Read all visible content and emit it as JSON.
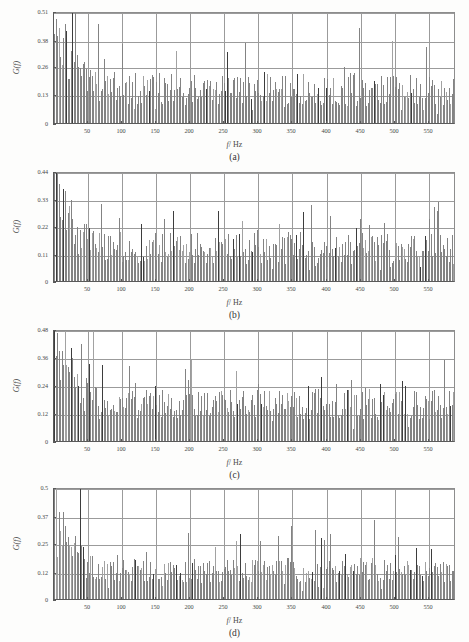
{
  "figure": {
    "type": "multi-panel-spectrum-figure",
    "panel_count": 4,
    "background_color": "#fdfdfc",
    "bar_color": "#838383",
    "bar_dark_color": "#3d3d3d",
    "grid_color": "#9b9b9b",
    "axis_color": "#5a5a5a"
  },
  "axis_labels": {
    "x_symbol": "f",
    "x_unit": "/ Hz",
    "y_text": "G(f)"
  },
  "captions": {
    "a": "(a)",
    "b": "(b)",
    "c": "(c)",
    "d": "(d)"
  },
  "chart_data": [
    {
      "id": "a",
      "type": "bar",
      "title": "(a)",
      "xlabel": "f/ Hz",
      "ylabel": "G(f)",
      "xlim": [
        0,
        590
      ],
      "ylim": [
        0,
        0.51
      ],
      "grid": true,
      "xticks": [
        50,
        100,
        150,
        200,
        250,
        300,
        350,
        400,
        450,
        500,
        550
      ],
      "xticklabels": [
        "50",
        "100",
        "150",
        "200",
        "250",
        "300",
        "350",
        "400",
        "450",
        "500",
        "550"
      ],
      "yticks": [
        0,
        0.13,
        0.26,
        0.38,
        0.51
      ],
      "yticklabels": [
        "0",
        "0.13",
        "0.26",
        "0.38",
        "0.51"
      ],
      "seed": 11,
      "baseline": 0.145,
      "noise": 0.075,
      "head_peak": 0.4,
      "head_decay": 26,
      "spike_rate": 0.085,
      "spike_gain": 1.55,
      "dark_rate": 0.055
    },
    {
      "id": "b",
      "type": "bar",
      "title": "(b)",
      "xlabel": "f/ Hz",
      "ylabel": "G(f)",
      "xlim": [
        0,
        590
      ],
      "ylim": [
        0,
        0.44
      ],
      "grid": true,
      "xticks": [
        50,
        100,
        150,
        200,
        250,
        300,
        350,
        400,
        450,
        500,
        550
      ],
      "xticklabels": [
        "50",
        "100",
        "150",
        "200",
        "250",
        "300",
        "350",
        "400",
        "450",
        "500",
        "550"
      ],
      "yticks": [
        0,
        0.11,
        0.22,
        0.33,
        0.44
      ],
      "yticklabels": [
        "0",
        "0.11",
        "0.22",
        "0.33",
        "0.44"
      ],
      "seed": 27,
      "baseline": 0.125,
      "noise": 0.062,
      "head_peak": 0.39,
      "head_decay": 20,
      "spike_rate": 0.08,
      "spike_gain": 1.5,
      "dark_rate": 0.06
    },
    {
      "id": "c",
      "type": "bar",
      "title": "(c)",
      "xlabel": "f/ Hz",
      "ylabel": "G(f)",
      "xlim": [
        0,
        590
      ],
      "ylim": [
        0,
        0.48
      ],
      "grid": true,
      "xticks": [
        50,
        100,
        150,
        200,
        250,
        300,
        350,
        400,
        450,
        500,
        550
      ],
      "xticklabels": [
        "50",
        "100",
        "150",
        "200",
        "250",
        "300",
        "350",
        "400",
        "450",
        "500",
        "550"
      ],
      "yticks": [
        0,
        0.12,
        0.24,
        0.36,
        0.48
      ],
      "yticklabels": [
        "0",
        "0.12",
        "0.24",
        "0.36",
        "0.48"
      ],
      "seed": 43,
      "baseline": 0.152,
      "noise": 0.065,
      "head_peak": 0.3,
      "head_decay": 30,
      "spike_rate": 0.075,
      "spike_gain": 1.45,
      "dark_rate": 0.05
    },
    {
      "id": "d",
      "type": "bar",
      "title": "(d)",
      "xlabel": "f/ Hz",
      "ylabel": "G(f)",
      "xlim": [
        0,
        590
      ],
      "ylim": [
        0,
        0.5
      ],
      "grid": true,
      "xticks": [
        50,
        100,
        150,
        200,
        250,
        300,
        350,
        400,
        450,
        500,
        550
      ],
      "xticklabels": [
        "50",
        "100",
        "150",
        "200",
        "250",
        "300",
        "350",
        "400",
        "450",
        "500",
        "550"
      ],
      "yticks": [
        0,
        0.12,
        0.25,
        0.37,
        0.5
      ],
      "yticklabels": [
        "0",
        "0.12",
        "0.25",
        "0.37",
        "0.5"
      ],
      "seed": 59,
      "baseline": 0.122,
      "noise": 0.055,
      "head_peak": 0.42,
      "head_decay": 18,
      "spike_rate": 0.07,
      "spike_gain": 1.6,
      "dark_rate": 0.055
    }
  ],
  "layout": {
    "panels": [
      {
        "id": "a",
        "top": 6,
        "plot_top": 12,
        "plot_height": 112,
        "caption_top": 152,
        "xlabel_top": 140
      },
      {
        "id": "b",
        "top": 166,
        "plot_top": 172,
        "plot_height": 110,
        "caption_top": 310,
        "xlabel_top": 298
      },
      {
        "id": "c",
        "top": 324,
        "plot_top": 330,
        "plot_height": 112,
        "caption_top": 470,
        "xlabel_top": 458
      },
      {
        "id": "d",
        "top": 484,
        "plot_top": 488,
        "plot_height": 112,
        "caption_top": 628,
        "xlabel_top": 616
      }
    ]
  }
}
